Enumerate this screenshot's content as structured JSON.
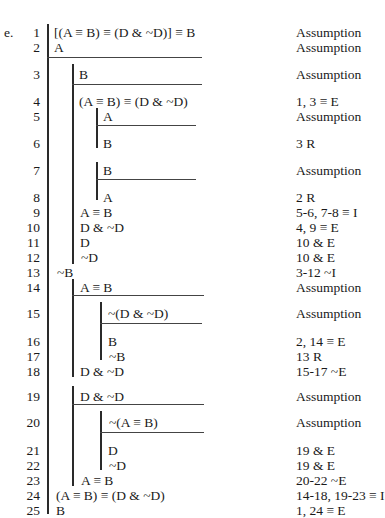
{
  "exercise_label": "e.",
  "lines": [
    {
      "n": "1",
      "formula": "[(A ≡ B) ≡ (D & ~D)] ≡ B",
      "justification": "Assumption"
    },
    {
      "n": "2",
      "formula": "A",
      "justification": "Assumption"
    },
    {
      "n": "3",
      "formula": "B",
      "justification": "Assumption"
    },
    {
      "n": "4",
      "formula": "(A ≡ B) ≡ (D & ~D)",
      "justification": "1, 3  ≡ E"
    },
    {
      "n": "5",
      "formula": "A",
      "justification": "Assumption"
    },
    {
      "n": "6",
      "formula": "B",
      "justification": "3 R"
    },
    {
      "n": "7",
      "formula": "B",
      "justification": "Assumption"
    },
    {
      "n": "8",
      "formula": "A",
      "justification": "2 R"
    },
    {
      "n": "9",
      "formula": "A ≡ B",
      "justification": "5-6, 7-8  ≡ I"
    },
    {
      "n": "10",
      "formula": "D & ~D",
      "justification": "4, 9  ≡ E"
    },
    {
      "n": "11",
      "formula": "D",
      "justification": "10  & E"
    },
    {
      "n": "12",
      "formula": "~D",
      "justification": "10  & E"
    },
    {
      "n": "13",
      "formula": "~B",
      "justification": "3-12  ~I"
    },
    {
      "n": "14",
      "formula": "A ≡ B",
      "justification": "Assumption"
    },
    {
      "n": "15",
      "formula": "~(D & ~D)",
      "justification": "Assumption"
    },
    {
      "n": "16",
      "formula": "B",
      "justification": "2, 14  ≡ E"
    },
    {
      "n": "17",
      "formula": "~B",
      "justification": "13 R"
    },
    {
      "n": "18",
      "formula": "D & ~D",
      "justification": "15-17  ~E"
    },
    {
      "n": "19",
      "formula": "D & ~D",
      "justification": "Assumption"
    },
    {
      "n": "20",
      "formula": "~(A ≡ B)",
      "justification": "Assumption"
    },
    {
      "n": "21",
      "formula": "D",
      "justification": "19  & E"
    },
    {
      "n": "22",
      "formula": "~D",
      "justification": "19  & E"
    },
    {
      "n": "23",
      "formula": "A ≡ B",
      "justification": "20-22  ~E"
    },
    {
      "n": "24",
      "formula": "(A ≡ B) ≡ (D & ~D)",
      "justification": "14-18, 19-23  ≡ I"
    },
    {
      "n": "25",
      "formula": "B",
      "justification": "1, 24  ≡ E"
    }
  ]
}
